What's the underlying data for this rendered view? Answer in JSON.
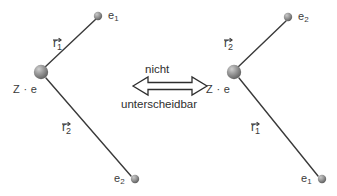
{
  "figure": {
    "background_color": "#ffffff",
    "line_color": "#3a3a3a",
    "text_color": "#3a3a3a",
    "sphere_color": "#8c8c8c"
  },
  "relation": {
    "top_label": "nicht",
    "bottom_label": "unterscheidbar",
    "arrow_icon": "double-headed-arrow-icon"
  },
  "left_diagram": {
    "nucleus": {
      "label": "Z · e",
      "icon": "nucleus-sphere-icon"
    },
    "electrons": [
      {
        "label": "e",
        "index": "1",
        "icon": "electron-sphere-icon",
        "position": "upper-right"
      },
      {
        "label": "e",
        "index": "2",
        "icon": "electron-sphere-icon",
        "position": "lower-right"
      }
    ],
    "vectors": [
      {
        "label": "r",
        "index": "1",
        "to": "e1"
      },
      {
        "label": "r",
        "index": "2",
        "to": "e2"
      }
    ]
  },
  "right_diagram": {
    "nucleus": {
      "label": "Z · e",
      "icon": "nucleus-sphere-icon"
    },
    "electrons": [
      {
        "label": "e",
        "index": "2",
        "icon": "electron-sphere-icon",
        "position": "upper-right"
      },
      {
        "label": "e",
        "index": "1",
        "icon": "electron-sphere-icon",
        "position": "lower-right"
      }
    ],
    "vectors": [
      {
        "label": "r",
        "index": "2",
        "to": "e2"
      },
      {
        "label": "r",
        "index": "1",
        "to": "e1"
      }
    ]
  }
}
